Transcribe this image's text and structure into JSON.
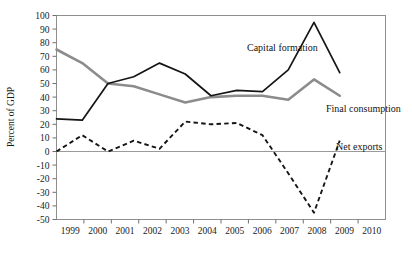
{
  "chart_data": {
    "type": "line",
    "title": "",
    "xlabel": "",
    "ylabel": "Percent of GDP",
    "xlim": [
      1999,
      2010.5
    ],
    "ylim": [
      -50,
      100
    ],
    "ytick_step": 10,
    "grid": false,
    "legend_position": "inline-annotations",
    "categories": [
      "1999",
      "2000",
      "2001",
      "2002",
      "2003",
      "2004",
      "2005",
      "2006",
      "2007",
      "2008",
      "2009",
      "2010"
    ],
    "x": [
      1999.0,
      1999.9,
      2000.8,
      2001.7,
      2002.6,
      2003.5,
      2004.4,
      2005.3,
      2006.2,
      2007.1,
      2008.0,
      2008.9
    ],
    "series": [
      {
        "name": "Capital formation",
        "style": "solid",
        "color": "#151515",
        "values": [
          24,
          23,
          50,
          55,
          65,
          57,
          41,
          45,
          44,
          60,
          95,
          58
        ]
      },
      {
        "name": "Final consumption",
        "style": "solid-thick",
        "color": "#8c8c8c",
        "values": [
          75,
          65,
          50,
          48,
          42,
          36,
          40,
          41,
          41,
          38,
          53,
          41
        ]
      },
      {
        "name": "Net exports",
        "style": "dashed",
        "color": "#151515",
        "values": [
          0,
          12,
          0,
          8,
          2,
          22,
          20,
          21,
          12,
          -16,
          -45,
          8
        ]
      }
    ],
    "yticks": [
      100,
      90,
      80,
      70,
      60,
      50,
      40,
      30,
      20,
      10,
      0,
      -10,
      -20,
      -30,
      -40,
      -50
    ],
    "annotations": [
      {
        "text": "Capital formation",
        "x": 247,
        "y": 51
      },
      {
        "text": "Final consumption",
        "x": 326,
        "y": 112
      },
      {
        "text": "Net exports",
        "x": 336,
        "y": 150
      }
    ]
  }
}
